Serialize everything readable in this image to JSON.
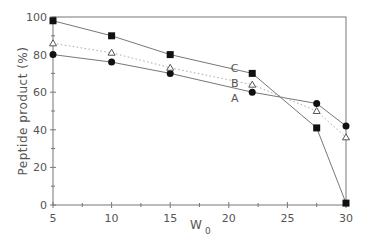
{
  "chart_data": {
    "type": "line",
    "title": "",
    "xlabel": "W",
    "xlabel_sub": "0",
    "ylabel": "Peptide product (%)",
    "xlim": [
      5,
      30
    ],
    "ylim": [
      0,
      100
    ],
    "xticks": [
      5,
      10,
      15,
      20,
      25,
      30
    ],
    "yticks": [
      0,
      20,
      40,
      60,
      80,
      100
    ],
    "grid": false,
    "x": [
      5,
      10,
      15,
      22,
      27.5,
      30
    ],
    "series": [
      {
        "name": "A",
        "marker": "circle-filled",
        "line": "solid",
        "values": [
          80,
          76,
          70,
          60,
          54,
          42
        ]
      },
      {
        "name": "B",
        "marker": "triangle-open",
        "line": "dotted",
        "values": [
          86,
          81,
          73,
          64,
          50,
          36
        ]
      },
      {
        "name": "C",
        "marker": "square-filled",
        "line": "solid",
        "values": [
          98,
          90,
          80,
          70,
          41,
          1
        ]
      }
    ],
    "annotations": [
      {
        "text": "C",
        "x": 20.5,
        "y": 73
      },
      {
        "text": "B",
        "x": 20.5,
        "y": 65
      },
      {
        "text": "A",
        "x": 20.5,
        "y": 57
      }
    ]
  }
}
